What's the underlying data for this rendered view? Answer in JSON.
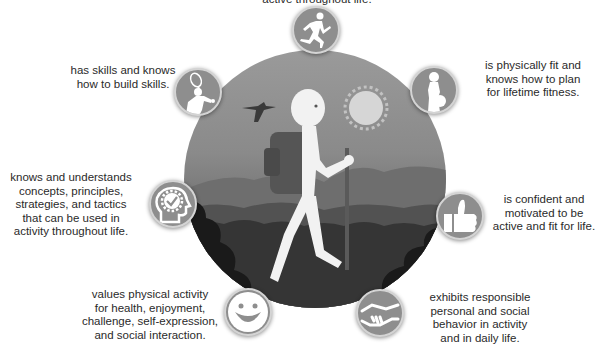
{
  "diagram": {
    "center_image": "hiker-with-backpack-and-walking-stick",
    "colors": {
      "badge_fill": "#8e8e8e",
      "badge_ring": "#d4d4d4",
      "icon_fill": "#ffffff",
      "text": "#2a2a2a"
    },
    "outcomes": [
      {
        "id": "top",
        "icon": "runner-icon",
        "text": "active throughout life."
      },
      {
        "id": "skills",
        "icon": "tennis-player-icon",
        "text": "has skills and knows\nhow to build skills."
      },
      {
        "id": "fitness",
        "icon": "weightlifter-icon",
        "text": "is physically fit and\nknows how to plan\nfor lifetime fitness."
      },
      {
        "id": "knowledge",
        "icon": "head-with-gear-check-icon",
        "text": "knows and understands\nconcepts, principles,\nstrategies, and tactics\nthat can be used in\nactivity throughout life."
      },
      {
        "id": "confidence",
        "icon": "thumbs-up-icon",
        "text": "is confident and\nmotivated to be\nactive and fit for life."
      },
      {
        "id": "values",
        "icon": "smiley-face-icon",
        "text": "values physical activity\nfor health, enjoyment,\nchallenge, self-expression,\nand social interaction."
      },
      {
        "id": "behavior",
        "icon": "handshake-icon",
        "text": "exhibits responsible\npersonal and social\nbehavior in activity\nand in daily life."
      }
    ]
  }
}
